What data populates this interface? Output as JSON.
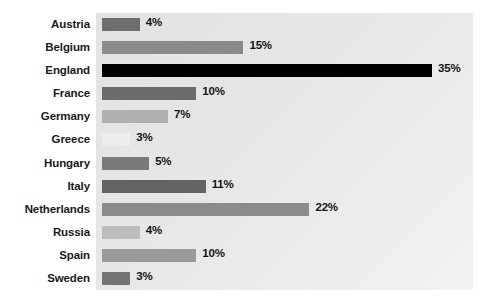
{
  "chart_data": {
    "type": "bar",
    "orientation": "horizontal",
    "title": "",
    "subtitle": "",
    "xlabel": "",
    "ylabel": "",
    "xlim": [
      0,
      40
    ],
    "grid": false,
    "legend": null,
    "value_suffix": "%",
    "categories": [
      "Austria",
      "Belgium",
      "England",
      "France",
      "Germany",
      "Greece",
      "Hungary",
      "Italy",
      "Netherlands",
      "Russia",
      "Spain",
      "Sweden"
    ],
    "values": [
      4,
      15,
      35,
      10,
      7,
      3,
      5,
      11,
      22,
      4,
      10,
      3
    ],
    "value_labels": [
      "4%",
      "15%",
      "35%",
      "10%",
      "7%",
      "3%",
      "5%",
      "11%",
      "22%",
      "4%",
      "10%",
      "3%"
    ],
    "bar_colors": [
      "#6e6e6e",
      "#8a8a8a",
      "#000000",
      "#6b6b6b",
      "#b0b0b0",
      "#ededed",
      "#7a7a7a",
      "#636363",
      "#8b8b8b",
      "#bdbdbd",
      "#9a9a9a",
      "#757575"
    ],
    "rows": [
      {
        "label": "Austria",
        "value": 4,
        "value_label": "4%",
        "color": "#6e6e6e"
      },
      {
        "label": "Belgium",
        "value": 15,
        "value_label": "15%",
        "color": "#8a8a8a"
      },
      {
        "label": "England",
        "value": 35,
        "value_label": "35%",
        "color": "#000000"
      },
      {
        "label": "France",
        "value": 10,
        "value_label": "10%",
        "color": "#6b6b6b"
      },
      {
        "label": "Germany",
        "value": 7,
        "value_label": "7%",
        "color": "#b0b0b0"
      },
      {
        "label": "Greece",
        "value": 3,
        "value_label": "3%",
        "color": "#ededed"
      },
      {
        "label": "Hungary",
        "value": 5,
        "value_label": "5%",
        "color": "#7a7a7a"
      },
      {
        "label": "Italy",
        "value": 11,
        "value_label": "11%",
        "color": "#636363"
      },
      {
        "label": "Netherlands",
        "value": 22,
        "value_label": "22%",
        "color": "#8b8b8b"
      },
      {
        "label": "Russia",
        "value": 4,
        "value_label": "4%",
        "color": "#bdbdbd"
      },
      {
        "label": "Spain",
        "value": 10,
        "value_label": "10%",
        "color": "#9a9a9a"
      },
      {
        "label": "Sweden",
        "value": 3,
        "value_label": "3%",
        "color": "#757575"
      }
    ]
  },
  "layout": {
    "panel_color": "#e8e8e8",
    "page_background": "#ffffff",
    "label_color": "#1a1a1a",
    "px_per_unit": 9.43,
    "bar_origin_x": 102
  }
}
